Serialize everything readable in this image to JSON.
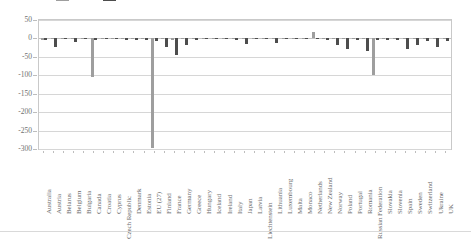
{
  "legend": {
    "entries": [
      {
        "label": "Series 1",
        "color": "#9e9e9e"
      },
      {
        "label": "Series 2",
        "color": "#4d4d4d"
      }
    ]
  },
  "axis": {
    "y_ticks": [
      "50",
      "0",
      "-50",
      "-100",
      "-150",
      "-200",
      "-250",
      "-300"
    ],
    "y_min": -300,
    "y_max": 50
  },
  "chart_data": {
    "type": "bar",
    "title": "",
    "subtitle": "",
    "xlabel": "",
    "ylabel": "",
    "ylim": [
      -300,
      50
    ],
    "grid": true,
    "legend_position": "top",
    "categories": [
      "Australia",
      "Austria",
      "Belarus",
      "Belgium",
      "Bulgaria",
      "Canada",
      "Croatia",
      "Cyprus",
      "Czech Republic",
      "Denmark",
      "Estonia",
      "EU (27)",
      "Finland",
      "France",
      "Germany",
      "Greece",
      "Hungary",
      "Iceland",
      "Ireland",
      "Italy",
      "Japan",
      "Latvia",
      "Liechtenstein",
      "Lithuania",
      "Luxembourg",
      "Malta",
      "Monaco",
      "Netherlands",
      "New Zealand",
      "Norway",
      "Poland",
      "Portugal",
      "Romania",
      "Russian Federation",
      "Slovakia",
      "Slovenia",
      "Spain",
      "Sweden",
      "Switzerland",
      "Ukraine",
      "UK"
    ],
    "series": [
      {
        "name": "Series 1",
        "color": "#9e9e9e",
        "values": [
          -4,
          -1,
          -1,
          -1,
          -2,
          -104,
          -1,
          -1,
          -1,
          -1,
          -1,
          -298,
          -2,
          -4,
          -2,
          -1,
          -1,
          -1,
          -1,
          -1,
          -1,
          -1,
          -1,
          -1,
          -1,
          -1,
          -1,
          18,
          -1,
          -2,
          -2,
          -1,
          -2,
          -98,
          -1,
          -1,
          -2,
          -2,
          -1,
          -2,
          -2
        ]
      },
      {
        "name": "Series 2",
        "color": "#4d4d4d",
        "values": [
          -5,
          -22,
          -2,
          -9,
          -2,
          -5,
          -2,
          -2,
          -3,
          -4,
          -3,
          -6,
          -24,
          -44,
          -18,
          -3,
          -2,
          -2,
          -2,
          -3,
          -15,
          -2,
          -2,
          -12,
          -2,
          -2,
          -2,
          2,
          -3,
          -17,
          -28,
          -3,
          -34,
          -4,
          -5,
          -3,
          -29,
          -19,
          -7,
          -24,
          -8
        ]
      }
    ]
  }
}
